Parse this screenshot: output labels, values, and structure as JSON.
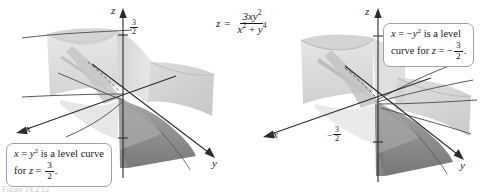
{
  "figure": {
    "equation": {
      "lhs": "z",
      "equals": "=",
      "numerator": "3xy",
      "numerator_exp": "2",
      "denominator_a": "x",
      "denominator_a_exp": "2",
      "denominator_plus": "+",
      "denominator_b": "y",
      "denominator_b_exp": "4"
    },
    "bottom_caption": "Figure 14.2.12"
  },
  "panels": [
    {
      "id": "left",
      "axes": {
        "x_label": "x",
        "y_label": "y",
        "z_label": "z"
      },
      "tick": {
        "sign": "",
        "numerator": "3",
        "denominator": "2"
      },
      "callout": {
        "line1_a": "x",
        "line1_eq": "=",
        "line1_var": "y",
        "line1_exp": "2",
        "line1_rest": "is a level curve",
        "line2_pre": "for",
        "line2_var": "z",
        "line2_eq": "=",
        "line2_sign": "",
        "line2_num": "3",
        "line2_den": "2",
        "line2_end": "."
      }
    },
    {
      "id": "right",
      "axes": {
        "x_label": "x",
        "y_label": "y",
        "z_label": "z"
      },
      "tick": {
        "sign": "−",
        "numerator": "3",
        "denominator": "2"
      },
      "callout": {
        "line1_a": "x",
        "line1_eq": "=",
        "line1_sign": "−",
        "line1_var": "y",
        "line1_exp": "2",
        "line1_rest": "is a level",
        "line2_pre": "curve for",
        "line2_var": "z",
        "line2_eq": "=",
        "line2_sign": "−",
        "line2_num": "3",
        "line2_den": "2",
        "line2_end": "."
      }
    }
  ],
  "colors": {
    "surface_light": "#dcdcdc",
    "surface_mid": "#c4c4c4",
    "surface_dark": "#8f8f8f",
    "surface_darkest": "#6f6f6f",
    "axis": "#2b2b2b",
    "curve": "#4a4a4a",
    "callout_border": "#9aa3ad",
    "background": "#ffffff"
  }
}
